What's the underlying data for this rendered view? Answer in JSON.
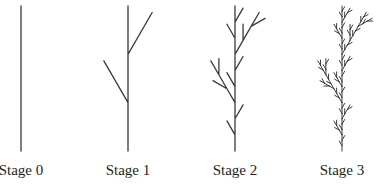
{
  "figure": {
    "type": "l-system-plant-stages",
    "lsystem": {
      "axiom": "F",
      "rules": {
        "F": "F[+F]F[-F]F"
      },
      "angle_deg": 30
    },
    "stroke_color": "#3a3a3a",
    "stages": [
      {
        "label": "Stage 0",
        "iterations": 0,
        "stem_x": 21
      },
      {
        "label": "Stage 1",
        "iterations": 1,
        "stem_x": 128
      },
      {
        "label": "Stage 2",
        "iterations": 2,
        "stem_x": 235
      },
      {
        "label": "Stage 3",
        "iterations": 3,
        "stem_x": 342
      }
    ],
    "stem_top_y": 6,
    "stem_bottom_y": 151
  }
}
